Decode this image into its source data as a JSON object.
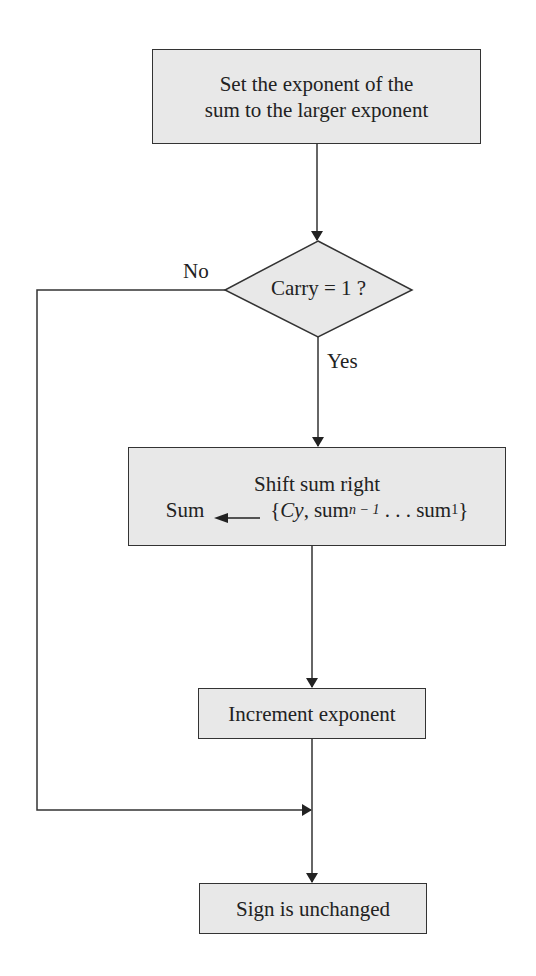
{
  "diagram": {
    "type": "flowchart",
    "nodes": {
      "set_exponent": {
        "line1": "Set the exponent of the",
        "line2": "sum to the larger exponent"
      },
      "carry_decision": {
        "text": "Carry = 1 ?",
        "no_label": "No",
        "yes_label": "Yes"
      },
      "shift_sum": {
        "title": "Shift sum right",
        "lhs": "Sum",
        "brace_open": "{",
        "cy": "Cy",
        "comma": ",",
        "sum_n": "sum",
        "sub_n": "n − 1",
        "dots": " . . . ",
        "sum_1": "sum",
        "sub_1": "1",
        "brace_close": "}"
      },
      "increment_exponent": {
        "text": "Increment exponent"
      },
      "sign_unchanged": {
        "text": "Sign is unchanged"
      }
    },
    "edges": [
      {
        "from": "set_exponent",
        "to": "carry_decision"
      },
      {
        "from": "carry_decision",
        "to": "shift_sum",
        "label": "Yes"
      },
      {
        "from": "carry_decision",
        "to": "merge",
        "label": "No"
      },
      {
        "from": "shift_sum",
        "to": "increment_exponent"
      },
      {
        "from": "increment_exponent",
        "to": "sign_unchanged"
      },
      {
        "from": "merge",
        "to": "sign_unchanged"
      }
    ],
    "colors": {
      "box_fill": "#e8e8e8",
      "stroke": "#333333"
    }
  }
}
